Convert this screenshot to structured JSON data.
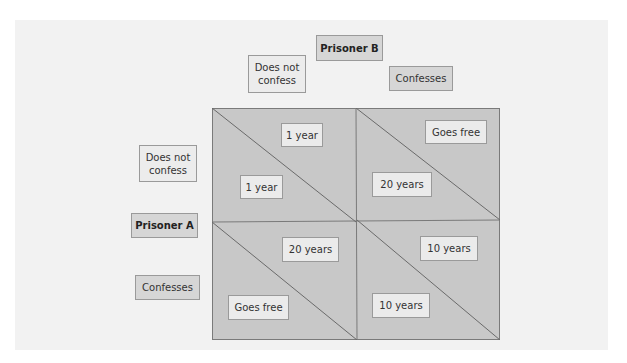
{
  "diagram": {
    "colors": {
      "background": "#f2f2f2",
      "matrix_fill": "#c8c8c8",
      "matrix_line": "#7a7a7a",
      "label_fill": "#ececec",
      "header_fill": "#d6d6d6"
    },
    "prisoner_b": {
      "label": "Prisoner B",
      "columns": [
        {
          "label": "Does not confess"
        },
        {
          "label": "Confesses"
        }
      ]
    },
    "prisoner_a": {
      "label": "Prisoner A",
      "rows": [
        {
          "label": "Does not confess"
        },
        {
          "label": "Confesses"
        }
      ]
    },
    "cells": [
      {
        "row": "Does not confess",
        "col": "Does not confess",
        "b_payoff": "1 year",
        "a_payoff": "1 year"
      },
      {
        "row": "Does not confess",
        "col": "Confesses",
        "b_payoff": "Goes free",
        "a_payoff": "20 years"
      },
      {
        "row": "Confesses",
        "col": "Does not confess",
        "b_payoff": "20 years",
        "a_payoff": "Goes free"
      },
      {
        "row": "Confesses",
        "col": "Confesses",
        "b_payoff": "10 years",
        "a_payoff": "10 years"
      }
    ]
  }
}
